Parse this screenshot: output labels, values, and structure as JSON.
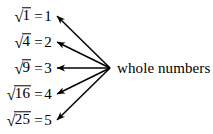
{
  "figure": {
    "background_color": "#ffffff",
    "ink_color": "#000000",
    "width": 213,
    "height": 134
  },
  "equations": [
    {
      "surd": "√",
      "radicand": "1",
      "equals": "=",
      "result": "1",
      "y": 16
    },
    {
      "surd": "√",
      "radicand": "4",
      "equals": "=",
      "result": "2",
      "y": 42
    },
    {
      "surd": "√",
      "radicand": "9",
      "equals": "=",
      "result": "3",
      "y": 68
    },
    {
      "surd": "√",
      "radicand": "16",
      "equals": "=",
      "result": "4",
      "y": 94
    },
    {
      "surd": "√",
      "radicand": "25",
      "equals": "=",
      "result": "5",
      "y": 120
    }
  ],
  "label": {
    "text": "whole numbers"
  },
  "arrows": {
    "origin_x": 110,
    "origin_y": 68,
    "tips": [
      {
        "x": 56,
        "y": 16
      },
      {
        "x": 56,
        "y": 42
      },
      {
        "x": 56,
        "y": 68
      },
      {
        "x": 56,
        "y": 94
      },
      {
        "x": 56,
        "y": 120
      }
    ]
  }
}
